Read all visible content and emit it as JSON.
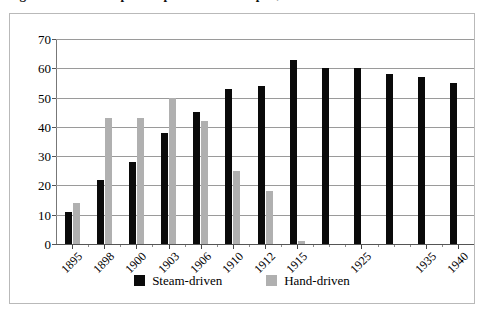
{
  "title": "Figure: Number of spindles per worker in Japan, 1895-1940",
  "legend": {
    "position": "bottom-center",
    "items": [
      {
        "label": "Steam-driven",
        "color": "#0a0a0a",
        "key": "steam"
      },
      {
        "label": "Hand-driven",
        "color": "#b0b0b0",
        "key": "hand"
      }
    ]
  },
  "axes": {
    "y": {
      "label": "",
      "min": 0,
      "max": 70,
      "step": 10,
      "ticks": [
        "0",
        "10",
        "20",
        "30",
        "40",
        "50",
        "60",
        "70"
      ]
    },
    "x": {
      "label": "",
      "tick_labels": [
        "1895",
        "1898",
        "1900",
        "1903",
        "1906",
        "1910",
        "1912",
        "1915",
        "1925",
        "1935",
        "1940"
      ]
    }
  },
  "chart_data": {
    "type": "bar",
    "title": "Figure: Number of spindles per worker in Japan, 1895-1940",
    "xlabel": "",
    "ylabel": "",
    "ylim": [
      0,
      70
    ],
    "ystep": 10,
    "grid": true,
    "legend_position": "bottom-center",
    "categories": [
      "1895",
      "1898",
      "1900",
      "1903",
      "1906",
      "1910",
      "1912",
      "1915",
      "",
      "1925",
      "",
      "1935",
      "1940"
    ],
    "labelled_categories": [
      "1895",
      "1898",
      "1900",
      "1903",
      "1906",
      "1910",
      "1912",
      "1915",
      "1925",
      "1935",
      "1940"
    ],
    "series": [
      {
        "name": "Steam-driven",
        "color": "#0a0a0a",
        "values": [
          11,
          22,
          28,
          38,
          45,
          53,
          54,
          63,
          60,
          60,
          58,
          57,
          55
        ]
      },
      {
        "name": "Hand-driven",
        "color": "#b0b0b0",
        "values": [
          14,
          43,
          43,
          50,
          42,
          25,
          18,
          1,
          0,
          0,
          0,
          0,
          0
        ]
      }
    ]
  }
}
